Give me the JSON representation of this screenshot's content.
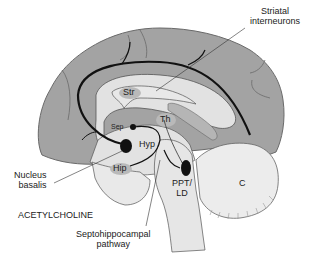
{
  "diagram": {
    "title": "ACETYLCHOLINE",
    "type": "sagittal brain section - cholinergic pathways",
    "colors": {
      "cortex": "#a3a3a3",
      "cortex_outline": "#6a6a6a",
      "inner_region": "#e2e2e2",
      "subcortical_gray": "#c6c6c6",
      "cerebellum": "#ececec",
      "pathway": "#111111",
      "nucleus": "#111111",
      "background": "#ffffff"
    },
    "regions": {
      "striatum": "Str",
      "thalamus": "Th",
      "septum": "Sep",
      "hypothalamus": "Hyp",
      "hippocampus": "Hip",
      "cerebellum": "C",
      "ppt_ld_line1": "PPT/",
      "ppt_ld_line2": "LD"
    },
    "callouts": {
      "striatal_line1": "Striatal",
      "striatal_line2": "interneurons",
      "nucleus_line1": "Nucleus",
      "nucleus_line2": "basalis",
      "septo_line1": "Septohippocampal",
      "septo_line2": "pathway"
    }
  }
}
